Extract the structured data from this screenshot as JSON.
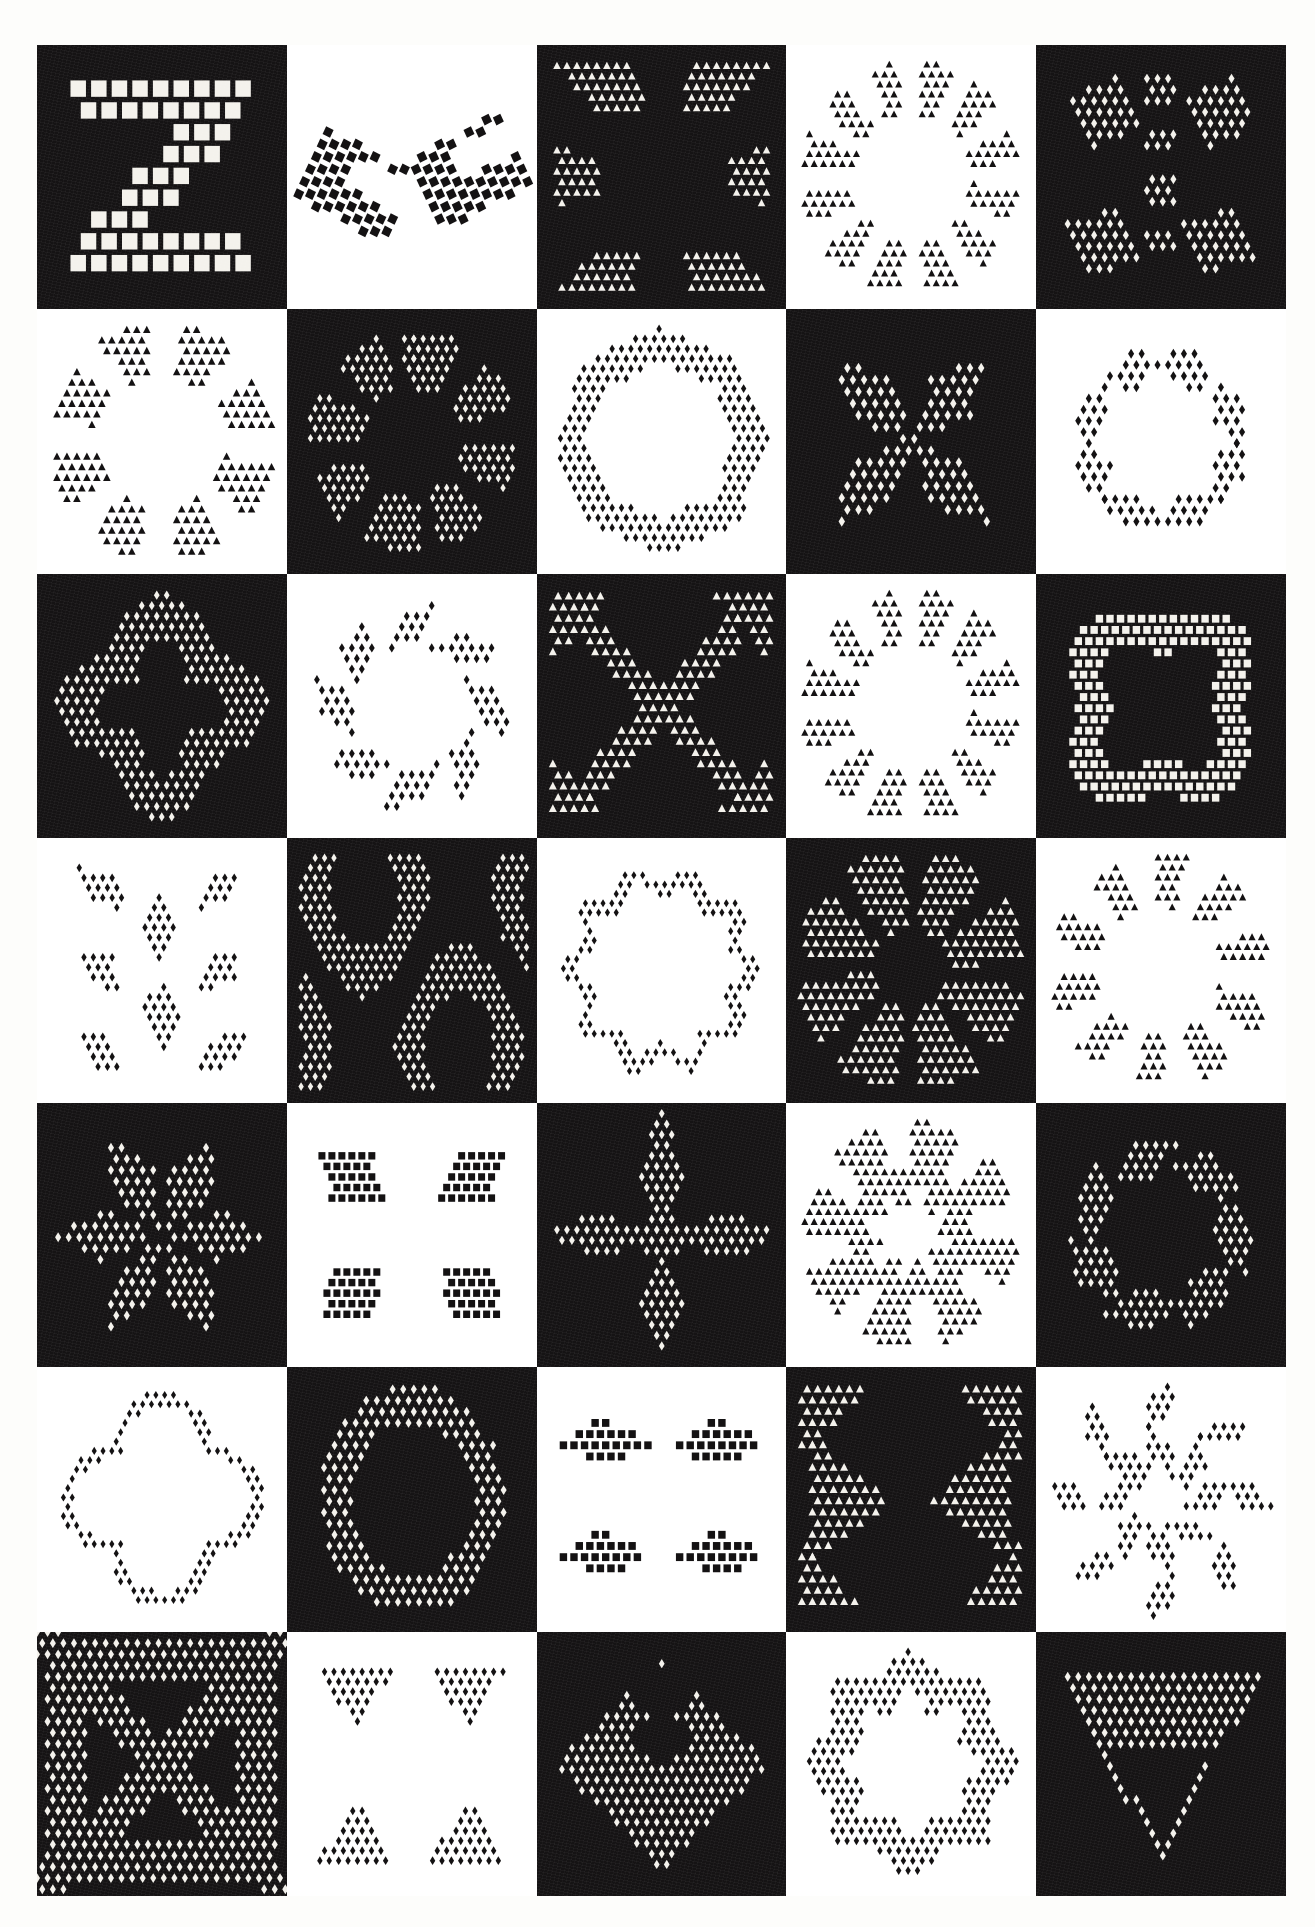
{
  "plate": {
    "title": "",
    "grid": {
      "columns": 5,
      "rows": 7,
      "cell_count": 35
    },
    "colors": {
      "dark": "#151314",
      "light": "#ffffff",
      "page": "#fdfdfb"
    },
    "background_order": "checkerboard, row 1 starts dark",
    "cells": [
      {
        "index": 1,
        "row": 1,
        "col": 1,
        "background": "dark",
        "motif": "zigzag-z-band",
        "motif_label": "Z band of squares",
        "unit": "square",
        "symmetry": "none",
        "dot_scale": 1.9
      },
      {
        "index": 2,
        "row": 1,
        "col": 2,
        "background": "light",
        "motif": "paired-chevrons",
        "motif_label": "Paired tilted chevrons",
        "unit": "square",
        "symmetry": "2-fold",
        "dot_scale": 1.0
      },
      {
        "index": 3,
        "row": 1,
        "col": 3,
        "background": "dark",
        "motif": "square-ring-triangles",
        "motif_label": "Square ring of triangles",
        "unit": "triangle",
        "symmetry": "4-fold",
        "dot_scale": 0.85
      },
      {
        "index": 4,
        "row": 1,
        "col": 4,
        "background": "light",
        "motif": "ring-of-bowties",
        "motif_label": "Circle of bowtie triangles",
        "unit": "triangle",
        "symmetry": "12-fold",
        "dot_scale": 0.8
      },
      {
        "index": 5,
        "row": 1,
        "col": 5,
        "background": "dark",
        "motif": "column-and-kites",
        "motif_label": "Central column with kites",
        "unit": "diamond",
        "symmetry": "2-fold-mirror",
        "dot_scale": 0.9
      },
      {
        "index": 6,
        "row": 2,
        "col": 1,
        "background": "light",
        "motif": "open-ring-chevrons",
        "motif_label": "Open ring of chevrons",
        "unit": "triangle",
        "symmetry": "4-fold",
        "dot_scale": 0.85
      },
      {
        "index": 7,
        "row": 2,
        "col": 2,
        "background": "dark",
        "motif": "rosette-hourglass",
        "motif_label": "Rosette of hourglasses",
        "unit": "diamond",
        "symmetry": "8-fold",
        "dot_scale": 0.8
      },
      {
        "index": 8,
        "row": 2,
        "col": 3,
        "background": "light",
        "motif": "octagon-band",
        "motif_label": "Octagonal band",
        "unit": "diamond",
        "symmetry": "8-fold",
        "dot_scale": 0.8
      },
      {
        "index": 9,
        "row": 2,
        "col": 4,
        "background": "dark",
        "motif": "four-petal-butterfly",
        "motif_label": "Four petal butterfly",
        "unit": "diamond",
        "symmetry": "2-fold-mirror",
        "dot_scale": 0.95
      },
      {
        "index": 10,
        "row": 2,
        "col": 5,
        "background": "light",
        "motif": "eight-petal-scatter",
        "motif_label": "Eight scattered petals",
        "unit": "diamond",
        "symmetry": "4-fold",
        "dot_scale": 0.9
      },
      {
        "index": 11,
        "row": 3,
        "col": 1,
        "background": "dark",
        "motif": "quatrefoil-ring",
        "motif_label": "Quatrefoil ring",
        "unit": "diamond",
        "symmetry": "4-fold",
        "dot_scale": 0.85
      },
      {
        "index": 12,
        "row": 3,
        "col": 2,
        "background": "light",
        "motif": "pinwheel-leaf-ring",
        "motif_label": "Pinwheel of leaves",
        "unit": "diamond",
        "symmetry": "8-fold",
        "dot_scale": 0.85
      },
      {
        "index": 13,
        "row": 3,
        "col": 3,
        "background": "dark",
        "motif": "x-cross-hooks",
        "motif_label": "X cross with hooks",
        "unit": "triangle",
        "symmetry": "2-fold-mirror",
        "dot_scale": 0.9
      },
      {
        "index": 14,
        "row": 3,
        "col": 4,
        "background": "light",
        "motif": "ring-of-triangles",
        "motif_label": "Ring of triangles",
        "unit": "triangle",
        "symmetry": "12-fold",
        "dot_scale": 0.8
      },
      {
        "index": 15,
        "row": 3,
        "col": 5,
        "background": "dark",
        "motif": "rounded-square-ring",
        "motif_label": "Rounded square ring",
        "unit": "square",
        "symmetry": "4-fold",
        "dot_scale": 0.9
      },
      {
        "index": 16,
        "row": 4,
        "col": 1,
        "background": "light",
        "motif": "vertical-leaf-pairs",
        "motif_label": "Vertical leaf pairs",
        "unit": "diamond",
        "symmetry": "2-fold-mirror",
        "dot_scale": 0.8
      },
      {
        "index": 17,
        "row": 4,
        "col": 2,
        "background": "dark",
        "motif": "interlace-lattice",
        "motif_label": "Interlaced lattice",
        "unit": "diamond",
        "symmetry": "2-fold-mirror",
        "dot_scale": 0.8
      },
      {
        "index": 18,
        "row": 4,
        "col": 3,
        "background": "light",
        "motif": "diamond-necklace",
        "motif_label": "Necklace of diamonds",
        "unit": "diamond",
        "symmetry": "12-fold",
        "dot_scale": 0.75
      },
      {
        "index": 19,
        "row": 4,
        "col": 4,
        "background": "dark",
        "motif": "starburst-octagon",
        "motif_label": "Starburst octagon",
        "unit": "triangle",
        "symmetry": "8-fold",
        "dot_scale": 0.85
      },
      {
        "index": 20,
        "row": 4,
        "col": 5,
        "background": "light",
        "motif": "ring-of-arrowheads",
        "motif_label": "Ring of arrowheads",
        "unit": "triangle",
        "symmetry": "10-fold",
        "dot_scale": 0.8
      },
      {
        "index": 21,
        "row": 5,
        "col": 1,
        "background": "dark",
        "motif": "six-petal-flower",
        "motif_label": "Six petal flower",
        "unit": "diamond",
        "symmetry": "6-fold",
        "dot_scale": 0.9
      },
      {
        "index": 22,
        "row": 5,
        "col": 2,
        "background": "light",
        "motif": "four-corner-clusters",
        "motif_label": "Four corner clusters",
        "unit": "square",
        "symmetry": "4-fold",
        "dot_scale": 0.85
      },
      {
        "index": 23,
        "row": 5,
        "col": 3,
        "background": "dark",
        "motif": "cross-of-leaves",
        "motif_label": "Cross of leaves",
        "unit": "diamond",
        "symmetry": "4-fold",
        "dot_scale": 0.85
      },
      {
        "index": 24,
        "row": 5,
        "col": 4,
        "background": "light",
        "motif": "star-of-triangles",
        "motif_label": "Star of triangles",
        "unit": "triangle",
        "symmetry": "8-fold",
        "dot_scale": 0.8
      },
      {
        "index": 25,
        "row": 5,
        "col": 5,
        "background": "dark",
        "motif": "spiral-leaf-ring",
        "motif_label": "Spiralling leaf ring",
        "unit": "diamond",
        "symmetry": "6-fold",
        "dot_scale": 0.85
      },
      {
        "index": 26,
        "row": 6,
        "col": 1,
        "background": "light",
        "motif": "quatrefoil-outline",
        "motif_label": "Quatrefoil outline",
        "unit": "diamond",
        "symmetry": "4-fold",
        "dot_scale": 0.75
      },
      {
        "index": 27,
        "row": 6,
        "col": 2,
        "background": "dark",
        "motif": "oval-wreath",
        "motif_label": "Oval wreath of leaves",
        "unit": "diamond",
        "symmetry": "2-fold-mirror",
        "dot_scale": 0.9
      },
      {
        "index": 28,
        "row": 6,
        "col": 3,
        "background": "light",
        "motif": "four-fan-blocks",
        "motif_label": "Four fan blocks",
        "unit": "square",
        "symmetry": "4-fold",
        "dot_scale": 0.9
      },
      {
        "index": 29,
        "row": 6,
        "col": 4,
        "background": "dark",
        "motif": "bowtie-cross",
        "motif_label": "Bowtie cross",
        "unit": "triangle",
        "symmetry": "2-fold-mirror",
        "dot_scale": 0.9
      },
      {
        "index": 30,
        "row": 6,
        "col": 5,
        "background": "light",
        "motif": "snowflake-leaves",
        "motif_label": "Snowflake of leaves",
        "unit": "diamond",
        "symmetry": "8-fold",
        "dot_scale": 0.8
      },
      {
        "index": 31,
        "row": 7,
        "col": 1,
        "background": "dark",
        "motif": "x-lattice-panel",
        "motif_label": "X lattice panel",
        "unit": "diamond",
        "symmetry": "2-fold-mirror",
        "dot_scale": 0.9
      },
      {
        "index": 32,
        "row": 7,
        "col": 2,
        "background": "light",
        "motif": "four-corner-triangles",
        "motif_label": "Four corner triangles",
        "unit": "diamond",
        "symmetry": "4-fold",
        "dot_scale": 0.8
      },
      {
        "index": 33,
        "row": 7,
        "col": 3,
        "background": "dark",
        "motif": "diamond-field",
        "motif_label": "Diamond field with notch",
        "unit": "diamond",
        "symmetry": "2-fold-mirror",
        "dot_scale": 0.85
      },
      {
        "index": 34,
        "row": 7,
        "col": 4,
        "background": "light",
        "motif": "octagon-star-ring",
        "motif_label": "Octagon star ring",
        "unit": "diamond",
        "symmetry": "8-fold",
        "dot_scale": 0.8
      },
      {
        "index": 35,
        "row": 7,
        "col": 5,
        "background": "dark",
        "motif": "big-triangle-panel",
        "motif_label": "Large triangle panel",
        "unit": "diamond",
        "symmetry": "mirror",
        "dot_scale": 0.9
      }
    ]
  }
}
